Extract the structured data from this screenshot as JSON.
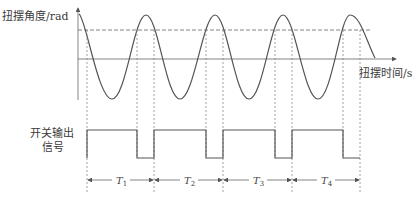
{
  "diagram": {
    "title": "",
    "y_axis_label": "扭摆角度/rad",
    "x_axis_label": "扭摆时间/s",
    "signal_label_line1": "开关输出",
    "signal_label_line2": "信号",
    "periods": [
      {
        "label": "T",
        "sub": "1"
      },
      {
        "label": "T",
        "sub": "2"
      },
      {
        "label": "T",
        "sub": "3"
      },
      {
        "label": "T",
        "sub": "4"
      }
    ],
    "colors": {
      "line": "#555555",
      "dashed": "#666666",
      "background": "#ffffff"
    }
  }
}
